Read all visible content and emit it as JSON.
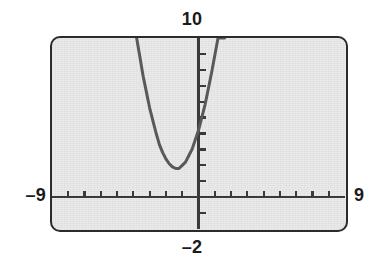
{
  "device": {
    "kind": "graphing-calculator-screen",
    "screen_bg_color": "#e9e9e9",
    "bezel_color": "#2b2b2b",
    "curve_color": "#595959",
    "axis_color": "#3a3a3a",
    "label_color": "#1a1a1a"
  },
  "window_labels": {
    "ymax": "10",
    "ymin": "–2",
    "xmin": "–9",
    "xmax": "9"
  },
  "chart_data": {
    "type": "line",
    "title": "",
    "xlabel": "",
    "ylabel": "",
    "xlim": [
      -9,
      9
    ],
    "ylim": [
      -2,
      10
    ],
    "grid": false,
    "legend": null,
    "axes": {
      "x_axis_at_y": 0,
      "y_axis_at_x": 0,
      "xscl": 1,
      "yscl": 1,
      "x_ticks": [
        -8,
        -7,
        -6,
        -5,
        -4,
        -3,
        -2,
        -1,
        1,
        2,
        3,
        4,
        5,
        6,
        7,
        8
      ],
      "y_ticks": [
        -1,
        1,
        2,
        3,
        4,
        5,
        6,
        7,
        8,
        9
      ]
    },
    "series": [
      {
        "name": "y1",
        "shape": "parabola",
        "vertex": [
          -2,
          0.6
        ],
        "color": "#595959",
        "x": [
          -3.8,
          -3.6,
          -3.4,
          -3.2,
          -3.0,
          -2.8,
          -2.6,
          -2.4,
          -2.2,
          -2.0,
          -1.8,
          -1.6,
          -1.4,
          -1.2,
          -1.0,
          -0.8,
          -0.6,
          -0.4,
          -0.2,
          0.0,
          0.2,
          0.4,
          0.6,
          0.8,
          1.0,
          1.2,
          1.4,
          1.6
        ],
        "y": [
          10.0,
          8.8,
          7.6,
          6.6,
          5.6,
          4.8,
          4.0,
          3.3,
          2.8,
          2.4,
          2.1,
          1.9,
          1.8,
          1.8,
          2.0,
          2.2,
          2.6,
          3.0,
          3.6,
          4.2,
          5.0,
          5.8,
          6.8,
          7.8,
          8.9,
          10.0,
          10.0,
          10.0
        ]
      }
    ]
  }
}
